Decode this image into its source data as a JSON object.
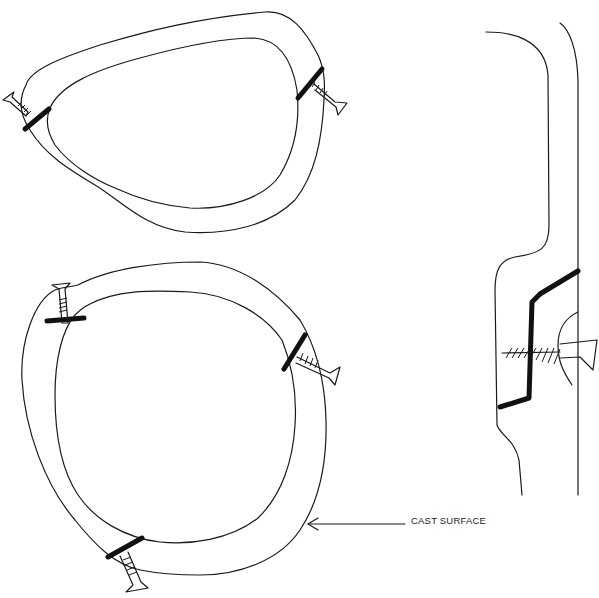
{
  "diagram": {
    "type": "technical line drawing",
    "figures": [
      {
        "name": "top-ring-view",
        "shape": "rounded triangular ring",
        "fasteners": 2
      },
      {
        "name": "bottom-ring-view",
        "shape": "circular ring",
        "fasteners": 3
      },
      {
        "name": "side-section-view",
        "shape": "vertical profile with stepped insert",
        "fasteners": 1
      }
    ],
    "annotations": [
      {
        "label": "CAST SURFACE",
        "points_to": "outer edge of bottom ring"
      }
    ],
    "colors": {
      "line": "#1a1a1a",
      "background": "#ffffff"
    }
  }
}
